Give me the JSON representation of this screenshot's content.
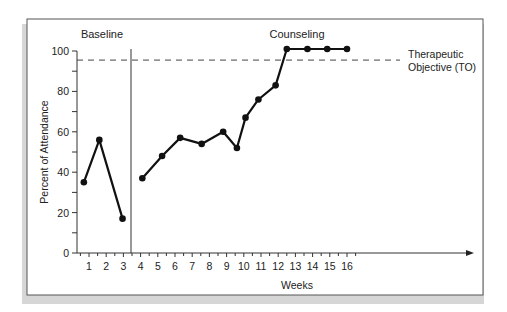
{
  "chart_data": {
    "type": "line",
    "title": "",
    "xlabel": "Weeks",
    "ylabel": "Percent of Attendance",
    "ylim": [
      0,
      100
    ],
    "yticks": [
      0,
      20,
      40,
      60,
      80,
      100
    ],
    "xticks": [
      1,
      2,
      3,
      4,
      5,
      6,
      7,
      8,
      9,
      10,
      11,
      12,
      13,
      14,
      15,
      16
    ],
    "grid": false,
    "phases": [
      {
        "name": "Baseline",
        "x": [
          0.7,
          1.6,
          2.95
        ],
        "values": [
          35,
          56,
          17
        ]
      },
      {
        "name": "Counseling",
        "x": [
          4.1,
          5.25,
          6.3,
          7.55,
          8.8,
          9.6,
          10.1,
          10.85,
          11.85,
          12.5,
          13.7,
          14.85,
          16.0
        ],
        "values": [
          37,
          48,
          57,
          54,
          60,
          52,
          67,
          76,
          83,
          101,
          101,
          101,
          101
        ]
      }
    ],
    "phase_change_line_x": 3.5,
    "reference_line": {
      "label_line1": "Therapeutic",
      "label_line2": "Objective (TO)",
      "value": 95.5,
      "style": "dashed"
    }
  },
  "labels": {
    "baseline": "Baseline",
    "counseling": "Counseling",
    "to_line1": "Therapeutic",
    "to_line2": "Objective (TO)",
    "xlabel": "Weeks",
    "ylabel": "Percent of Attendance"
  }
}
